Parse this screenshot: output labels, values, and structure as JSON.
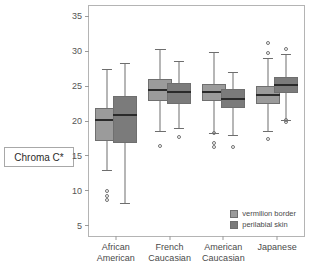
{
  "chart_data": {
    "type": "box",
    "title": "",
    "xlabel": "",
    "ylabel": "Chroma C*",
    "ylim": [
      3.5,
      36.5
    ],
    "yticks": [
      5,
      10,
      15,
      20,
      25,
      30,
      35
    ],
    "ytick_labels": [
      "5",
      "10",
      "15",
      "20",
      "25",
      "30",
      "35"
    ],
    "grid": false,
    "legend_position": "bottom-right",
    "categories": [
      "African American",
      "French Caucasian",
      "American Caucasian",
      "Japanese"
    ],
    "category_lines": [
      [
        "African",
        "American"
      ],
      [
        "French",
        "Caucasian"
      ],
      [
        "American",
        "Caucasian"
      ],
      [
        "Japanese",
        ""
      ]
    ],
    "series": [
      {
        "name": "vermilion border",
        "color": "#9b9b9b",
        "boxes": [
          {
            "category": "African American",
            "whisker_low": 13.0,
            "q1": 17.1,
            "median": 20.1,
            "q3": 21.9,
            "whisker_high": 27.4,
            "outliers": [
              10.0,
              9.3,
              8.6
            ]
          },
          {
            "category": "French Caucasian",
            "whisker_low": 18.5,
            "q1": 22.8,
            "median": 24.4,
            "q3": 26.0,
            "whisker_high": 30.4,
            "outliers": [
              16.4
            ]
          },
          {
            "category": "American Caucasian",
            "whisker_low": 18.3,
            "q1": 22.8,
            "median": 24.1,
            "q3": 25.3,
            "whisker_high": 29.9,
            "outliers": [
              18.3,
              16.8,
              16.2
            ]
          },
          {
            "category": "Japanese",
            "whisker_low": 18.6,
            "q1": 22.5,
            "median": 23.8,
            "q3": 25.0,
            "whisker_high": 29.0,
            "outliers": [
              31.2,
              29.8,
              17.4
            ]
          }
        ]
      },
      {
        "name": "perilabial skin",
        "color": "#7b7b7b",
        "boxes": [
          {
            "category": "African American",
            "whisker_low": 8.3,
            "q1": 16.9,
            "median": 20.9,
            "q3": 23.6,
            "whisker_high": 28.3,
            "outliers": []
          },
          {
            "category": "French Caucasian",
            "whisker_low": 19.0,
            "q1": 22.5,
            "median": 24.1,
            "q3": 25.4,
            "whisker_high": 28.6,
            "outliers": [
              17.7
            ]
          },
          {
            "category": "American Caucasian",
            "whisker_low": 18.0,
            "q1": 21.8,
            "median": 23.2,
            "q3": 24.6,
            "whisker_high": 27.1,
            "outliers": [
              16.3
            ]
          },
          {
            "category": "Japanese",
            "whisker_low": 20.2,
            "q1": 24.0,
            "median": 25.2,
            "q3": 26.3,
            "whisker_high": 29.6,
            "outliers": [
              30.4,
              20.2,
              19.9
            ]
          }
        ]
      }
    ],
    "legend": [
      {
        "label": "vermilion border",
        "color": "#9b9b9b"
      },
      {
        "label": "perilabial skin",
        "color": "#7b7b7b"
      }
    ]
  }
}
